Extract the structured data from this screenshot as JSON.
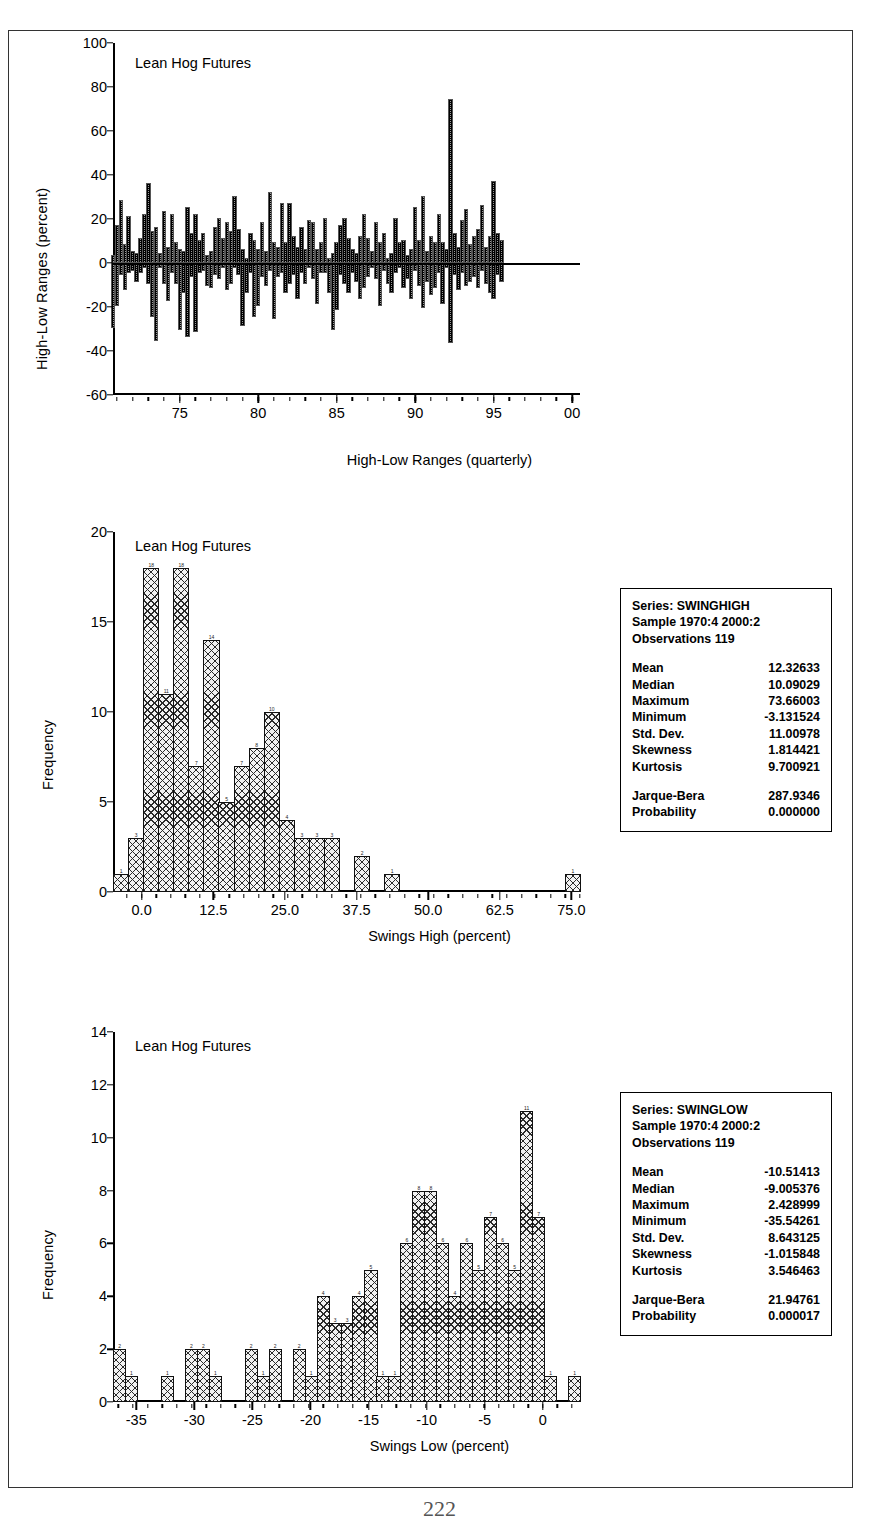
{
  "page": {
    "number": "222"
  },
  "charts": [
    {
      "id": "high-low-ranges",
      "type": "bar",
      "title": "Lean Hog Futures",
      "ylabel": "High-Low Ranges (percent)",
      "xlabel": "High-Low Ranges (quarterly)",
      "ylim": [
        -60,
        100
      ],
      "yticks": [
        "100",
        "80",
        "60",
        "40",
        "20",
        "0",
        "-20",
        "-40",
        "-60"
      ],
      "ytick_values": [
        100,
        80,
        60,
        40,
        20,
        0,
        -20,
        -40,
        -60
      ],
      "xticks": [
        "75",
        "80",
        "85",
        "90",
        "95",
        "00"
      ],
      "xtick_values": [
        1975,
        1980,
        1985,
        1990,
        1995,
        2000
      ],
      "xlim": [
        1970.75,
        2000.5
      ],
      "grid": false,
      "note": "Quarterly high-low swing ranges, positive = swing high, negative = swing low",
      "x": [
        1970.75,
        1971.0,
        1971.25,
        1971.5,
        1971.75,
        1972.0,
        1972.25,
        1972.5,
        1972.75,
        1973.0,
        1973.25,
        1973.5,
        1973.75,
        1974.0,
        1974.25,
        1974.5,
        1974.75,
        1975.0,
        1975.25,
        1975.5,
        1975.75,
        1976.0,
        1976.25,
        1976.5,
        1976.75,
        1977.0,
        1977.25,
        1977.5,
        1977.75,
        1978.0,
        1978.25,
        1978.5,
        1978.75,
        1979.0,
        1979.25,
        1979.5,
        1979.75,
        1980.0,
        1980.25,
        1980.5,
        1980.75,
        1981.0,
        1981.25,
        1981.5,
        1981.75,
        1982.0,
        1982.25,
        1982.5,
        1982.75,
        1983.0,
        1983.25,
        1983.5,
        1983.75,
        1984.0,
        1984.25,
        1984.5,
        1984.75,
        1985.0,
        1985.25,
        1985.5,
        1985.75,
        1986.0,
        1986.25,
        1986.5,
        1986.75,
        1987.0,
        1987.25,
        1987.5,
        1987.75,
        1988.0,
        1988.25,
        1988.5,
        1988.75,
        1989.0,
        1989.25,
        1989.5,
        1989.75,
        1990.0,
        1990.25,
        1990.5,
        1990.75,
        1991.0,
        1991.25,
        1991.5,
        1991.75,
        1992.0,
        1992.25,
        1992.5,
        1992.75,
        1993.0,
        1993.25,
        1993.5,
        1993.75,
        1994.0,
        1994.25,
        1994.5,
        1994.75,
        1995.0,
        1995.25,
        1995.5,
        1995.75,
        1996.0,
        1996.25,
        1996.5,
        1996.75,
        1997.0,
        1997.25,
        1997.5,
        1997.75,
        1998.0,
        1998.25,
        1998.5,
        1998.75,
        1999.0,
        1999.25,
        1999.5,
        1999.75,
        2000.0,
        2000.25
      ],
      "high": [
        3,
        17,
        28,
        8,
        21,
        5,
        4,
        11,
        22,
        36,
        14,
        16,
        4,
        23,
        7,
        22,
        9,
        6,
        5,
        25,
        13,
        22,
        10,
        13,
        3,
        5,
        16,
        20,
        11,
        18,
        14,
        30,
        15,
        6,
        2,
        13,
        10,
        6,
        18,
        5,
        32,
        9,
        7,
        27,
        9,
        27,
        12,
        7,
        16,
        6,
        19,
        18,
        6,
        9,
        20,
        2,
        4,
        9,
        17,
        20,
        11,
        6,
        4,
        12,
        22,
        11,
        5,
        18,
        9,
        13,
        2,
        4,
        20,
        9,
        10,
        3,
        6,
        25,
        10,
        30,
        5,
        12,
        9,
        22,
        9,
        6,
        74,
        13,
        7,
        19,
        24,
        8,
        12,
        15,
        26,
        7,
        12,
        37,
        13,
        10
      ],
      "low": [
        -29,
        -19,
        -5,
        -12,
        -4,
        -3,
        -8,
        -4,
        -2,
        -9,
        -24,
        -35,
        -2,
        -9,
        -17,
        -4,
        -9,
        -30,
        -13,
        -33,
        -6,
        -31,
        -4,
        -3,
        -10,
        -11,
        -5,
        -7,
        -2,
        -12,
        -9,
        -2,
        -5,
        -28,
        -13,
        -4,
        -24,
        -19,
        -6,
        -10,
        -3,
        -25,
        -6,
        -4,
        -13,
        -9,
        -5,
        -16,
        -4,
        -9,
        -2,
        -7,
        -18,
        -4,
        -4,
        -13,
        -30,
        -21,
        -5,
        -9,
        -13,
        -4,
        -8,
        -16,
        -11,
        -6,
        -2,
        -7,
        -19,
        -3,
        -9,
        -13,
        -4,
        -2,
        -11,
        -7,
        -16,
        -3,
        -10,
        -20,
        -8,
        -14,
        -11,
        -4,
        -18,
        -2,
        -36,
        -5,
        -12,
        -4,
        -10,
        -8,
        -6,
        -11,
        -3,
        -9,
        -13,
        -16,
        -5,
        -8
      ]
    },
    {
      "id": "swings-high-histogram",
      "type": "bar",
      "title": "Lean Hog Futures",
      "ylabel": "Frequency",
      "xlabel": "Swings High (percent)",
      "ylim": [
        0,
        20
      ],
      "yticks": [
        "20",
        "15",
        "10",
        "5",
        "0"
      ],
      "ytick_values": [
        20,
        15,
        10,
        5,
        0
      ],
      "xticks": [
        "0.0",
        "12.5",
        "25.0",
        "37.5",
        "50.0",
        "62.5",
        "75.0"
      ],
      "xtick_values": [
        0.0,
        12.5,
        25.0,
        37.5,
        50.0,
        62.5,
        75.0
      ],
      "xlim": [
        -5.0,
        76.5
      ],
      "grid": false,
      "bin_width": 2.55,
      "bin_starts": [
        -5.0,
        -2.45,
        0.1,
        2.65,
        5.2,
        7.75,
        10.3,
        12.85,
        15.4,
        17.95,
        20.5,
        23.05,
        25.6,
        28.15,
        30.7,
        33.25,
        35.8,
        38.35,
        40.9,
        43.45,
        46.0,
        48.55,
        51.1,
        53.65,
        56.2,
        58.75,
        61.3,
        63.85,
        66.4,
        68.95,
        71.5
      ],
      "values": [
        1,
        3,
        18,
        11,
        18,
        7,
        14,
        5,
        7,
        8,
        10,
        4,
        3,
        3,
        3,
        0,
        2,
        0,
        1,
        0,
        0,
        0,
        0,
        0,
        0,
        0,
        0,
        0,
        0,
        0,
        1
      ]
    },
    {
      "id": "swings-low-histogram",
      "type": "bar",
      "title": "Lean Hog Futures",
      "ylabel": "Frequency",
      "xlabel": "Swings Low (percent)",
      "ylim": [
        0,
        14
      ],
      "yticks": [
        "14",
        "12",
        "10",
        "8",
        "6",
        "4",
        "2",
        "0"
      ],
      "ytick_values": [
        14,
        12,
        10,
        8,
        6,
        4,
        2,
        0
      ],
      "xticks": [
        "-35",
        "-30",
        "-25",
        "-20",
        "-15",
        "-10",
        "-5",
        "0"
      ],
      "xtick_values": [
        -35,
        -30,
        -25,
        -20,
        -15,
        -10,
        -5,
        0
      ],
      "xlim": [
        -37.0,
        3.2
      ],
      "grid": false,
      "bin_width": 1.26,
      "bin_starts": [
        -36.2,
        -34.94,
        -33.68,
        -32.42,
        -31.16,
        -29.9,
        -28.64,
        -27.38,
        -26.12,
        -24.86,
        -23.6,
        -22.34,
        -21.08,
        -19.82,
        -18.56,
        -17.3,
        -16.04,
        -14.78,
        -13.52,
        -12.26,
        -11.0,
        -9.74,
        -8.48,
        -7.22,
        -5.96,
        -4.7,
        -3.44,
        -2.18,
        -0.92,
        0.34,
        1.6
      ],
      "values": [
        2,
        1,
        0,
        0,
        1,
        0,
        2,
        2,
        1,
        0,
        0,
        2,
        1,
        2,
        0,
        2,
        1,
        4,
        3,
        3,
        4,
        5,
        1,
        1,
        6,
        8,
        8,
        6,
        4,
        6,
        5,
        7,
        6,
        5,
        11,
        7,
        1,
        0,
        1
      ]
    }
  ],
  "stat_boxes": [
    {
      "id": "swinghigh-stats",
      "header": [
        "Series: SWINGHIGH",
        "Sample 1970:4 2000:2",
        "Observations 119"
      ],
      "rows": [
        {
          "key": "Mean",
          "value": "12.32633"
        },
        {
          "key": "Median",
          "value": "10.09029"
        },
        {
          "key": "Maximum",
          "value": "73.66003"
        },
        {
          "key": "Minimum",
          "value": "-3.131524"
        },
        {
          "key": "Std. Dev.",
          "value": "11.00978"
        },
        {
          "key": "Skewness",
          "value": "1.814421"
        },
        {
          "key": "Kurtosis",
          "value": "9.700921"
        }
      ],
      "rows2": [
        {
          "key": "Jarque-Bera",
          "value": "287.9346"
        },
        {
          "key": "Probability",
          "value": "0.000000"
        }
      ]
    },
    {
      "id": "swinglow-stats",
      "header": [
        "Series: SWINGLOW",
        "Sample 1970:4 2000:2",
        "Observations 119"
      ],
      "rows": [
        {
          "key": "Mean",
          "value": "-10.51413"
        },
        {
          "key": "Median",
          "value": "-9.005376"
        },
        {
          "key": "Maximum",
          "value": "2.428999"
        },
        {
          "key": "Minimum",
          "value": "-35.54261"
        },
        {
          "key": "Std. Dev.",
          "value": "8.643125"
        },
        {
          "key": "Skewness",
          "value": "-1.015848"
        },
        {
          "key": "Kurtosis",
          "value": "3.546463"
        }
      ],
      "rows2": [
        {
          "key": "Jarque-Bera",
          "value": "21.94761"
        },
        {
          "key": "Probability",
          "value": "0.000017"
        }
      ]
    }
  ],
  "chart_data": {
    "type": "bar",
    "panels": [
      {
        "name": "High-Low Ranges (quarterly)",
        "type": "bar",
        "title": "Lean Hog Futures",
        "xlabel": "High-Low Ranges (quarterly)",
        "ylabel": "High-Low Ranges (percent)",
        "ylim": [
          -60,
          100
        ],
        "yticks": [
          100,
          80,
          60,
          40,
          20,
          0,
          -20,
          -40,
          -60
        ],
        "xticks": [
          1975,
          1980,
          1985,
          1990,
          1995,
          2000
        ],
        "xtick_labels": [
          "75",
          "80",
          "85",
          "90",
          "95",
          "00"
        ],
        "grid": false,
        "series": [
          {
            "name": "Swing High",
            "values": [
              3,
              17,
              28,
              8,
              21,
              5,
              4,
              11,
              22,
              36,
              14,
              16,
              4,
              23,
              7,
              22,
              9,
              6,
              5,
              25,
              13,
              22,
              10,
              13,
              3,
              5,
              16,
              20,
              11,
              18,
              14,
              30,
              15,
              6,
              2,
              13,
              10,
              6,
              18,
              5,
              32,
              9,
              7,
              27,
              9,
              27,
              12,
              7,
              16,
              6,
              19,
              18,
              6,
              9,
              20,
              2,
              4,
              9,
              17,
              20,
              11,
              6,
              4,
              12,
              22,
              11,
              5,
              18,
              9,
              13,
              2,
              4,
              20,
              9,
              10,
              3,
              6,
              25,
              10,
              30,
              5,
              12,
              9,
              22,
              9,
              6,
              74,
              13,
              7,
              19,
              24,
              8,
              12,
              15,
              26,
              7,
              12,
              37,
              13,
              10
            ]
          },
          {
            "name": "Swing Low",
            "values": [
              -29,
              -19,
              -5,
              -12,
              -4,
              -3,
              -8,
              -4,
              -2,
              -9,
              -24,
              -35,
              -2,
              -9,
              -17,
              -4,
              -9,
              -30,
              -13,
              -33,
              -6,
              -31,
              -4,
              -3,
              -10,
              -11,
              -5,
              -7,
              -2,
              -12,
              -9,
              -2,
              -5,
              -28,
              -13,
              -4,
              -24,
              -19,
              -6,
              -10,
              -3,
              -25,
              -6,
              -4,
              -13,
              -9,
              -5,
              -16,
              -4,
              -9,
              -2,
              -7,
              -18,
              -4,
              -4,
              -13,
              -30,
              -21,
              -5,
              -9,
              -13,
              -4,
              -8,
              -16,
              -11,
              -6,
              -2,
              -7,
              -19,
              -3,
              -9,
              -13,
              -4,
              -2,
              -11,
              -7,
              -16,
              -3,
              -10,
              -20,
              -8,
              -14,
              -11,
              -4,
              -18,
              -2,
              -36,
              -5,
              -12,
              -4,
              -10,
              -8,
              -6,
              -11,
              -3,
              -9,
              -13,
              -16,
              -5,
              -8
            ]
          }
        ]
      },
      {
        "name": "Swings High histogram",
        "type": "bar",
        "title": "Lean Hog Futures",
        "xlabel": "Swings High (percent)",
        "ylabel": "Frequency",
        "ylim": [
          0,
          20
        ],
        "yticks": [
          20,
          15,
          10,
          5,
          0
        ],
        "xticks": [
          0.0,
          12.5,
          25.0,
          37.5,
          50.0,
          62.5,
          75.0
        ],
        "grid": false,
        "bin_centers": [
          -3.7,
          -1.2,
          1.4,
          3.9,
          6.5,
          9.0,
          11.6,
          14.1,
          16.7,
          19.2,
          21.8,
          24.3,
          26.9,
          29.4,
          32.0,
          34.5,
          37.1,
          39.6,
          42.2,
          44.7,
          47.3,
          49.8,
          52.4,
          54.9,
          57.5,
          60.0,
          62.6,
          65.1,
          67.7,
          70.2,
          72.8
        ],
        "values": [
          1,
          3,
          18,
          11,
          18,
          7,
          14,
          5,
          7,
          8,
          10,
          4,
          3,
          3,
          3,
          0,
          2,
          0,
          1,
          0,
          0,
          0,
          0,
          0,
          0,
          0,
          0,
          0,
          0,
          0,
          1
        ],
        "statistics": {
          "series": "SWINGHIGH",
          "sample": "1970:4 2000:2",
          "observations": 119,
          "mean": 12.32633,
          "median": 10.09029,
          "maximum": 73.66003,
          "minimum": -3.131524,
          "std_dev": 11.00978,
          "skewness": 1.814421,
          "kurtosis": 9.700921,
          "jarque_bera": 287.9346,
          "probability": 0.0
        }
      },
      {
        "name": "Swings Low histogram",
        "type": "bar",
        "title": "Lean Hog Futures",
        "xlabel": "Swings Low (percent)",
        "ylabel": "Frequency",
        "ylim": [
          0,
          14
        ],
        "yticks": [
          14,
          12,
          10,
          8,
          6,
          4,
          2,
          0
        ],
        "xticks": [
          -35,
          -30,
          -25,
          -20,
          -15,
          -10,
          -5,
          0
        ],
        "grid": false,
        "bin_centers": [
          -35.6,
          -34.3,
          -33.1,
          -31.8,
          -30.5,
          -29.3,
          -28.0,
          -26.8,
          -25.5,
          -24.2,
          -23.0,
          -21.7,
          -20.5,
          -19.2,
          -17.9,
          -16.7,
          -15.4,
          -14.2,
          -12.9,
          -11.6,
          -10.4,
          -9.1,
          -7.9,
          -6.6,
          -5.3,
          -4.1,
          -2.8,
          -1.6,
          -0.3,
          1.0,
          2.2
        ],
        "values": [
          2,
          1,
          0,
          0,
          1,
          0,
          2,
          2,
          1,
          0,
          0,
          2,
          1,
          2,
          0,
          2,
          1,
          4,
          3,
          3,
          4,
          5,
          1,
          1,
          6,
          8,
          8,
          6,
          4,
          6,
          5,
          7,
          6,
          5,
          11,
          7,
          1,
          0,
          1
        ],
        "statistics": {
          "series": "SWINGLOW",
          "sample": "1970:4 2000:2",
          "observations": 119,
          "mean": -10.51413,
          "median": -9.005376,
          "maximum": 2.428999,
          "minimum": -35.54261,
          "std_dev": 8.643125,
          "skewness": -1.015848,
          "kurtosis": 3.546463,
          "jarque_bera": 21.94761,
          "probability": 1.7e-05
        }
      }
    ]
  }
}
